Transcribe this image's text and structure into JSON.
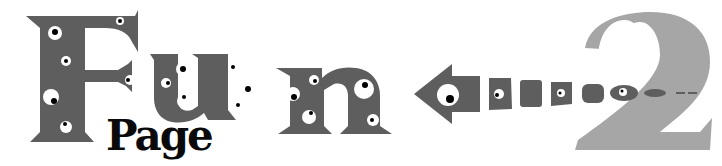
{
  "logo": {
    "title_word": "Fun",
    "subtitle_word": "Page",
    "number": "2",
    "letters": [
      "F",
      "u",
      "n"
    ]
  },
  "colors": {
    "background": "#ffffff",
    "letter_gray": "#5e5e5e",
    "number_gray": "#a6a6a6",
    "page_black": "#0a0a0a",
    "eye_white": "#ffffff",
    "pupil": "#000000"
  },
  "icons": {
    "arrow": "left-arrow-icon",
    "eyes": "googly-eye-icon"
  }
}
